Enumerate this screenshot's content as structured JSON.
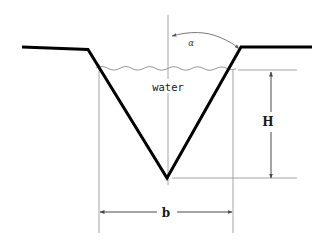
{
  "figure": {
    "kind": "engineering-cross-section",
    "background_color": "#ffffff",
    "thick_line_color": "#000000",
    "thin_line_color": "#8c8c8c",
    "water_line_color": "#9a9a9a",
    "text_color": "#1a1a1a"
  },
  "labels": {
    "water": "water",
    "angle": "α",
    "depth": "H",
    "width": "b"
  },
  "geometry": {
    "ground_left": {
      "x1": 22,
      "y1": 47,
      "x2": 88,
      "y2": 49
    },
    "ground_right": {
      "x1": 241,
      "y1": 47,
      "x2": 312,
      "y2": 47
    },
    "bank_left": {
      "x1": 88,
      "y1": 49,
      "x2": 167,
      "y2": 178
    },
    "bank_right": {
      "x1": 167,
      "y1": 178,
      "x2": 241,
      "y2": 47
    },
    "apex": {
      "x": 167,
      "y": 178
    },
    "water_surface_y": 68,
    "water_surface_x1": 96,
    "water_surface_x2": 240,
    "centerline": {
      "x": 168,
      "y1": 15,
      "y2": 185
    }
  },
  "dimensions": {
    "H": {
      "label": "H",
      "meaning": "flow depth from water surface to channel invert",
      "arrow_x": 271,
      "y_top": 72,
      "y_bottom": 178,
      "label_x": 267,
      "label_y": 122
    },
    "b": {
      "label": "b",
      "meaning": "water surface top width",
      "arrow_y": 212,
      "x_left": 100,
      "x_right": 232,
      "label_x": 166,
      "label_y": 217
    },
    "alpha": {
      "label": "α",
      "meaning": "side slope angle measured from the vertical centerline",
      "label_x": 191,
      "label_y": 45
    }
  }
}
